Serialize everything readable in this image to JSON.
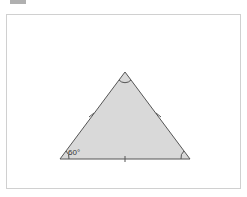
{
  "diagram": {
    "type": "equilateral triangle",
    "angle_label": "60°",
    "colors": {
      "fill": "#d9d9d9",
      "stroke": "#555555",
      "frame": "#d0d0d0"
    },
    "vertices": {
      "top": [
        125,
        72
      ],
      "bottom_left": [
        60,
        159
      ],
      "bottom_right": [
        190,
        159
      ]
    }
  }
}
